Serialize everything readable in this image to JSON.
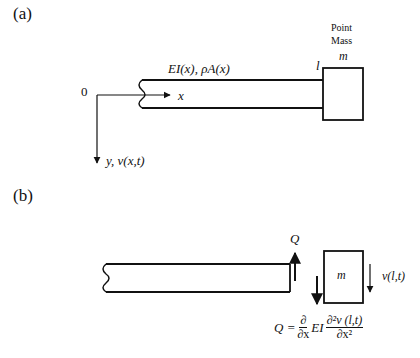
{
  "panel_a": {
    "label": "(a)",
    "origin_label": "0",
    "x_axis_label": "x",
    "y_axis_label": "y, v(x,t)",
    "beam_properties": "EI(x), ρA(x)",
    "end_label": "l",
    "mass_title_line1": "Point",
    "mass_title_line2": "Mass",
    "mass_symbol": "m"
  },
  "panel_b": {
    "label": "(b)",
    "shear_label": "Q",
    "mass_symbol": "m",
    "displacement_label": "v(l,t)",
    "equation": {
      "lhs": "Q =",
      "d_num": "∂",
      "d_den": "∂x",
      "mid": "EI",
      "d2_num": "∂²v (l,t)",
      "d2_den": "∂x²"
    }
  }
}
